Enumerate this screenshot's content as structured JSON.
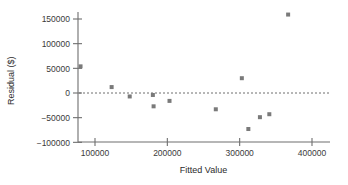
{
  "chart_data": {
    "type": "scatter",
    "title": "",
    "xlabel": "Fitted Value",
    "ylabel": "Residual ($)",
    "xlim": [
      60000,
      420000
    ],
    "ylim": [
      -110000,
      170000
    ],
    "xticks": [
      100000,
      200000,
      300000,
      400000
    ],
    "xtick_labels": [
      "100000",
      "200000",
      "300000",
      "400000"
    ],
    "yticks": [
      -100000,
      -50000,
      0,
      50000,
      100000,
      150000
    ],
    "ytick_labels": [
      "-100000",
      "-50000",
      "0",
      "50000",
      "100000",
      "150000"
    ],
    "grid": false,
    "legend": null,
    "reference_line": {
      "orientation": "horizontal",
      "value": 0,
      "style": "dotted",
      "color": "#6e6e6e"
    },
    "marker": {
      "shape": "square",
      "color": "#7a7a7a",
      "size_px": 4
    },
    "axis_color": "#6e6e6e",
    "points": [
      {
        "x": 80000,
        "y": 54000
      },
      {
        "x": 123000,
        "y": 12000
      },
      {
        "x": 148000,
        "y": -7000
      },
      {
        "x": 180000,
        "y": -4000
      },
      {
        "x": 181000,
        "y": -27000
      },
      {
        "x": 203000,
        "y": -16000
      },
      {
        "x": 267000,
        "y": -33000
      },
      {
        "x": 303000,
        "y": 30000
      },
      {
        "x": 312000,
        "y": -73000
      },
      {
        "x": 328000,
        "y": -49000
      },
      {
        "x": 341000,
        "y": -43000
      },
      {
        "x": 367000,
        "y": 159000
      }
    ]
  }
}
